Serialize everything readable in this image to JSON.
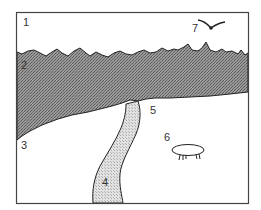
{
  "diagram": {
    "type": "landscape-illustration",
    "colors": {
      "frame": "#444444",
      "dark_band_fill": "#8c8c8c",
      "path_fill": "#d4d4d4",
      "background": "#ffffff",
      "outline": "#222222"
    },
    "labels": [
      {
        "id": "1",
        "text": "1",
        "region": "sky"
      },
      {
        "id": "2",
        "text": "2",
        "region": "dark-band"
      },
      {
        "id": "3",
        "text": "3",
        "region": "left-ground"
      },
      {
        "id": "4",
        "text": "4",
        "region": "path"
      },
      {
        "id": "5",
        "text": "5",
        "region": "path-start"
      },
      {
        "id": "6",
        "text": "6",
        "region": "creature"
      },
      {
        "id": "7",
        "text": "7",
        "region": "bird"
      }
    ]
  }
}
